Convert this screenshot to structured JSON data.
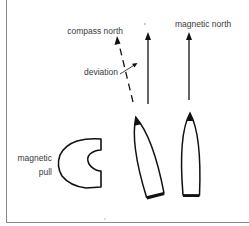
{
  "diagram": {
    "labels": {
      "compass_north": "compass north",
      "magnetic_north": "magnetic north",
      "deviation": "deviation",
      "magnetic_pull_line1": "magnetic",
      "magnetic_pull_line2": "pull"
    },
    "elements": [
      {
        "id": "compass-north-arrow",
        "style": "dashed",
        "meaning": "compass north (deflected)"
      },
      {
        "id": "true-heading-arrow",
        "style": "solid",
        "meaning": "magnetic north reference for deviated boat"
      },
      {
        "id": "magnetic-north-arrow",
        "style": "solid",
        "meaning": "magnetic north"
      },
      {
        "id": "deviation-pointer",
        "style": "thin arrow",
        "meaning": "deviation angle"
      },
      {
        "id": "magnet",
        "shape": "C-shaped horseshoe",
        "meaning": "magnetic pull source"
      },
      {
        "id": "boat-deviated",
        "shape": "hull, tilted"
      },
      {
        "id": "boat-upright",
        "shape": "hull, upright"
      }
    ],
    "colors": {
      "ink": "#111111",
      "text": "#3a3a3a",
      "frame": "#8a8a8a",
      "background": "#ffffff"
    }
  }
}
